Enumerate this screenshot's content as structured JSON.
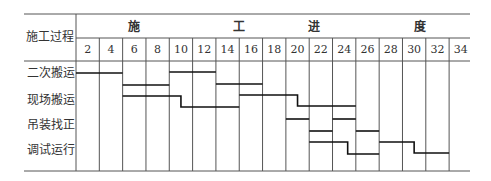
{
  "chart_data": {
    "type": "gantt",
    "title": "",
    "row_header": "施工过程",
    "column_group_header": [
      "施",
      "工",
      "进",
      "度"
    ],
    "column_group_header_full": "施工进度",
    "x_ticks": [
      2,
      4,
      6,
      8,
      10,
      12,
      14,
      16,
      18,
      20,
      22,
      24,
      26,
      28,
      30,
      32,
      34
    ],
    "x_unit": "天",
    "xlim": [
      0,
      34
    ],
    "grid": true,
    "rows": [
      "二次搬运",
      "现场搬运",
      "吊装找正",
      "调试运行"
    ],
    "bars": [
      {
        "task": "二次搬运",
        "segments": [
          {
            "start": 0,
            "end": 4,
            "level": 73
          }
        ]
      },
      {
        "task": "二次搬运",
        "segments": [
          {
            "start": 8,
            "end": 12,
            "level": 72
          }
        ]
      },
      {
        "task": "二次搬运",
        "segments": [
          {
            "start": 12,
            "end": 16,
            "level": 84
          }
        ]
      },
      {
        "task": "现场搬运",
        "segments": [
          {
            "start": 4,
            "end": 8,
            "level": 85
          }
        ]
      },
      {
        "task": "现场搬运",
        "segments": [
          {
            "start": 4,
            "end": 9,
            "level": 96
          },
          {
            "start": 9,
            "end": 14,
            "level": 107
          }
        ]
      },
      {
        "task": "现场搬运",
        "segments": [
          {
            "start": 14,
            "end": 19,
            "level": 95
          },
          {
            "start": 19,
            "end": 24,
            "level": 106
          }
        ]
      },
      {
        "task": "吊装找正",
        "segments": [
          {
            "start": 18,
            "end": 20,
            "level": 119
          }
        ]
      },
      {
        "task": "吊装找正",
        "segments": [
          {
            "start": 22,
            "end": 24,
            "level": 119
          }
        ]
      },
      {
        "task": "吊装找正",
        "segments": [
          {
            "start": 20,
            "end": 22,
            "level": 131
          }
        ]
      },
      {
        "task": "吊装找正",
        "segments": [
          {
            "start": 24,
            "end": 26,
            "level": 131
          }
        ]
      },
      {
        "task": "调试运行",
        "segments": [
          {
            "start": 20,
            "end": 23.3,
            "level": 142
          },
          {
            "start": 23.3,
            "end": 26,
            "level": 154
          }
        ]
      },
      {
        "task": "调试运行",
        "segments": [
          {
            "start": 26,
            "end": 29,
            "level": 142
          },
          {
            "start": 29,
            "end": 32,
            "level": 153
          }
        ]
      }
    ]
  },
  "layout": {
    "x0": 76,
    "day_px": 11.66,
    "table_left": 24,
    "table_right": 470,
    "top": 14,
    "mid": 38,
    "head_bottom": 61,
    "bottom": 171,
    "label_col_right": 76,
    "row_label_y": [
      73,
      100,
      125,
      150
    ],
    "group_header_x": [
      134,
      239,
      314,
      420
    ],
    "group_header_y": 27
  }
}
